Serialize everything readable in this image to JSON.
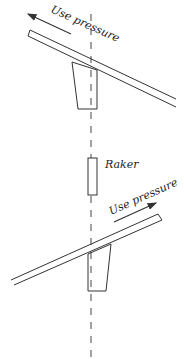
{
  "diagram": {
    "top_arrow_label": "Use pressure",
    "middle_label": "Raker",
    "bottom_arrow_label": "Use pressure",
    "colors": {
      "line": "#333333",
      "background": "#ffffff"
    }
  }
}
